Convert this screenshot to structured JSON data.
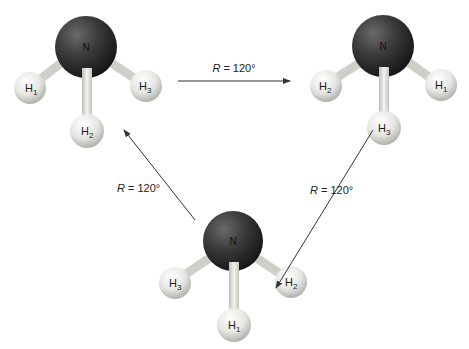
{
  "diagram": {
    "type": "ammonia rotation cycle",
    "molecules": [
      {
        "id": "top-left",
        "center": "N",
        "hydrogens": [
          {
            "label": "H",
            "sub": "1",
            "position": "left"
          },
          {
            "label": "H",
            "sub": "2",
            "position": "bottom"
          },
          {
            "label": "H",
            "sub": "3",
            "position": "right"
          }
        ]
      },
      {
        "id": "top-right",
        "center": "N",
        "hydrogens": [
          {
            "label": "H",
            "sub": "2",
            "position": "left"
          },
          {
            "label": "H",
            "sub": "3",
            "position": "bottom"
          },
          {
            "label": "H",
            "sub": "1",
            "position": "right"
          }
        ]
      },
      {
        "id": "bottom",
        "center": "N",
        "hydrogens": [
          {
            "label": "H",
            "sub": "3",
            "position": "left"
          },
          {
            "label": "H",
            "sub": "1",
            "position": "bottom"
          },
          {
            "label": "H",
            "sub": "2",
            "position": "right"
          }
        ]
      }
    ],
    "arrows": [
      {
        "id": "top",
        "from": "top-left",
        "to": "top-right",
        "label_var": "R",
        "label_rest": " = 120°"
      },
      {
        "id": "right",
        "from": "top-right",
        "to": "bottom",
        "label_var": "R",
        "label_rest": " = 120°"
      },
      {
        "id": "left",
        "from": "bottom",
        "to": "top-left",
        "label_var": "R",
        "label_rest": " = 120°"
      }
    ],
    "colors": {
      "nitrogen": "#3a3a3a",
      "hydrogen": "#e8e8e8",
      "bond": "#dcdcd6",
      "arrow": "#333333"
    }
  }
}
